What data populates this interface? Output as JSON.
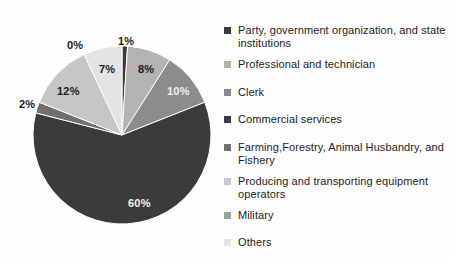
{
  "chart_data": {
    "type": "pie",
    "title": "",
    "subtitle": "",
    "xlabel": "",
    "ylabel": "",
    "legend_position": "right",
    "grid": false,
    "start_angle_deg": 0,
    "direction": "clockwise",
    "units": "percent",
    "categories": [
      "Party, government organization, and state institutions",
      "Professional and technician",
      "Clerk",
      "Commercial services",
      "Farming,Forestry, Animal Husbandry, and Fishery",
      "Producing and transporting equipment operators",
      "Military",
      "Others"
    ],
    "values": [
      1,
      8,
      10,
      60,
      2,
      12,
      0,
      7
    ],
    "value_labels": [
      "1%",
      "8%",
      "10%",
      "60%",
      "2%",
      "12%",
      "0%",
      "7%"
    ],
    "colors": [
      "#3a3a3a",
      "#b3b3b3",
      "#8c8c8c",
      "#3b3b3b",
      "#6f6f6f",
      "#c6c6c6",
      "#9f9f9f",
      "#e3e3e3"
    ]
  },
  "chart": {
    "geometry": {
      "center_x": 122,
      "center_y": 135,
      "radius": 89
    },
    "slices": [
      {
        "label": "1%",
        "value": 1,
        "name": "party-government-organization-and-state-institutions",
        "color": "#3a3a3a",
        "label_x": 118,
        "label_y": 35,
        "label_on_dark": false
      },
      {
        "label": "8%",
        "value": 8,
        "name": "professional-and-technician",
        "color": "#b3b3b3",
        "label_x": 138,
        "label_y": 63,
        "label_on_dark": false
      },
      {
        "label": "10%",
        "value": 10,
        "name": "clerk",
        "color": "#8c8c8c",
        "label_x": 167,
        "label_y": 85,
        "label_on_dark": true
      },
      {
        "label": "60%",
        "value": 60,
        "name": "commercial-services",
        "color": "#3b3b3b",
        "label_x": 128,
        "label_y": 197,
        "label_on_dark": true
      },
      {
        "label": "2%",
        "value": 2,
        "name": "farming-forestry-animal-husbandry-and-fishery",
        "color": "#6f6f6f",
        "label_x": 19,
        "label_y": 98,
        "label_on_dark": false
      },
      {
        "label": "12%",
        "value": 12,
        "name": "producing-and-transporting-equipment-operators",
        "color": "#c6c6c6",
        "label_x": 57,
        "label_y": 85,
        "label_on_dark": false
      },
      {
        "label": "0%",
        "value": 0,
        "name": "military",
        "color": "#9f9f9f",
        "label_x": 67,
        "label_y": 39,
        "label_on_dark": false
      },
      {
        "label": "7%",
        "value": 7,
        "name": "others",
        "color": "#e3e3e3",
        "label_x": 99,
        "label_y": 63,
        "label_on_dark": false
      }
    ]
  },
  "legend": {
    "items": [
      {
        "label": "Party, government organization, and state institutions",
        "name": "legend-item-party-government-organization-and-state-institutions",
        "color": "#3a3a3a",
        "top": 14
      },
      {
        "label": "Professional and technician",
        "name": "legend-item-professional-and-technician",
        "color": "#b3b3b3",
        "top": 48
      },
      {
        "label": "Clerk",
        "name": "legend-item-clerk",
        "color": "#8c8c8c",
        "top": 76
      },
      {
        "label": "Commercial services",
        "name": "legend-item-commercial-services",
        "color": "#3b3b3b",
        "top": 103
      },
      {
        "label": "Farming,Forestry, Animal Husbandry, and Fishery",
        "name": "legend-item-farming-forestry-animal-husbandry-and-fishery",
        "color": "#6f6f6f",
        "top": 131
      },
      {
        "label": "Producing and transporting equipment operators",
        "name": "legend-item-producing-and-transporting-equipment-operators",
        "color": "#c6c6c6",
        "top": 165
      },
      {
        "label": "Military",
        "name": "legend-item-military",
        "color": "#9f9f9f",
        "top": 199
      },
      {
        "label": "Others",
        "name": "legend-item-others",
        "color": "#e3e3e3",
        "top": 226
      }
    ]
  }
}
